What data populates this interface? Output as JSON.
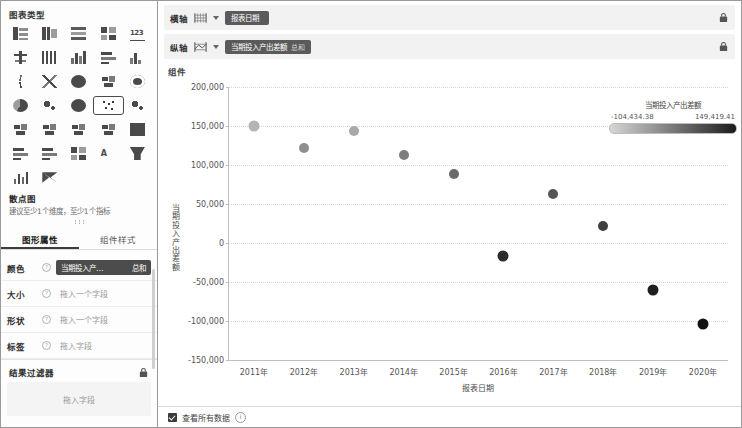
{
  "left_panel": {
    "title": "图表类型",
    "chart_type_icons": [
      {
        "name": "table-icon",
        "glyph": "g1"
      },
      {
        "name": "cross-table-icon",
        "glyph": "g2"
      },
      {
        "name": "detail-table-icon",
        "glyph": "g3"
      },
      {
        "name": "summary-table-icon",
        "glyph": "g4"
      },
      {
        "name": "kpi-number-icon",
        "glyph": "g5",
        "text": "123"
      },
      {
        "name": "column-chart-icon",
        "glyph": "g6"
      },
      {
        "name": "stacked-column-icon",
        "glyph": "g7"
      },
      {
        "name": "bar-chart-icon",
        "glyph": "g8"
      },
      {
        "name": "horizontal-bar-icon",
        "glyph": "g9"
      },
      {
        "name": "histogram-icon",
        "glyph": "ghist"
      },
      {
        "name": "area-chart-icon",
        "glyph": "g11"
      },
      {
        "name": "radar-chart-icon",
        "glyph": "g12"
      },
      {
        "name": "polar-chart-icon",
        "glyph": "gcirc"
      },
      {
        "name": "map-chart-icon",
        "glyph": "gmap"
      },
      {
        "name": "gauge-chart-icon",
        "glyph": "gring"
      },
      {
        "name": "pie-chart-icon",
        "glyph": "ghalf"
      },
      {
        "name": "donut-chart-icon",
        "glyph": "gbubble"
      },
      {
        "name": "sunburst-chart-icon",
        "glyph": "gcirc"
      },
      {
        "name": "scatter-chart-icon",
        "glyph": "gscat",
        "selected": true
      },
      {
        "name": "bubble-chart-icon",
        "glyph": "gbubble"
      },
      {
        "name": "tree-map-icon",
        "glyph": "gmap"
      },
      {
        "name": "funnel-map-icon",
        "glyph": "gmap"
      },
      {
        "name": "relation-chart-icon",
        "glyph": "gmap"
      },
      {
        "name": "sankey-chart-icon",
        "glyph": "gmap"
      },
      {
        "name": "heatmap-icon",
        "glyph": "gsq"
      },
      {
        "name": "gantt-chart-icon",
        "glyph": "g9"
      },
      {
        "name": "timeline-chart-icon",
        "glyph": "g9"
      },
      {
        "name": "matrix-chart-icon",
        "glyph": "g4"
      },
      {
        "name": "word-cloud-icon",
        "glyph": "gA",
        "text": "A"
      },
      {
        "name": "funnel-chart-icon",
        "glyph": "gfunnel"
      },
      {
        "name": "waterfall-chart-icon",
        "glyph": "g10"
      },
      {
        "name": "butterfly-chart-icon",
        "glyph": "gbow"
      }
    ],
    "selected_type_name": "散点图",
    "selected_type_hint": "建议至少1个维度，至少1个指标",
    "tabs": [
      {
        "label": "图形属性",
        "active": true
      },
      {
        "label": "组件样式",
        "active": false
      }
    ],
    "property_rows": [
      {
        "label": "颜色",
        "kind": "pill",
        "value": "当期投入产…",
        "badge": "总和"
      },
      {
        "label": "大小",
        "kind": "placeholder",
        "placeholder": "拖入一个字段"
      },
      {
        "label": "形状",
        "kind": "placeholder",
        "placeholder": "拖入一个字段"
      },
      {
        "label": "标签",
        "kind": "placeholder",
        "placeholder": "拖入字段"
      }
    ],
    "filter_section": {
      "title": "结果过滤器",
      "lock_icon": "lock-icon",
      "dropzone_placeholder": "拖入字段"
    }
  },
  "axis_bars": [
    {
      "name": "横轴",
      "icon": "horizontal-axis-icon",
      "field": "报表日期",
      "agg": "",
      "lock_icon": "lock-icon"
    },
    {
      "name": "纵轴",
      "icon": "vertical-axis-icon",
      "field": "当期投入产出差额",
      "agg": "总和",
      "lock_icon": "lock-icon"
    }
  ],
  "component_label": "组件",
  "legend": {
    "title": "当期投入产出差额",
    "min_label": "-104,434.38",
    "max_label": "149,419.41",
    "gradient_from": "#d6d6d6",
    "gradient_to": "#1c1c1c"
  },
  "status_bar": {
    "checkbox_checked": true,
    "label": "查看所有数据",
    "info_icon": "info-icon",
    "info_glyph": "i"
  },
  "chart_data": {
    "type": "scatter",
    "title": "",
    "xlabel": "报表日期",
    "ylabel": "当期投入产出差额",
    "categories": [
      "2011年",
      "2012年",
      "2013年",
      "2014年",
      "2015年",
      "2016年",
      "2017年",
      "2018年",
      "2019年",
      "2020年"
    ],
    "values": [
      149419.41,
      122000,
      143000,
      112800,
      88000,
      -17000,
      62500,
      21500,
      -60000,
      -104434.38
    ],
    "point_colors": [
      "#b4b4b4",
      "#8f8f8f",
      "#a8a8a8",
      "#7d7d7d",
      "#6a6a6a",
      "#2b2b2b",
      "#555555",
      "#3f3f3f",
      "#1f1f1f",
      "#121212"
    ],
    "point_sizes": [
      11,
      10,
      10,
      10,
      10,
      11,
      10,
      10,
      11,
      11
    ],
    "ylim": [
      -150000,
      200000
    ],
    "yticks": [
      200000,
      150000,
      100000,
      50000,
      0,
      -50000,
      -100000,
      -150000
    ],
    "ytick_labels": [
      "200,000",
      "150,000",
      "100,000",
      "50,000",
      "0",
      "-50,000",
      "-100,000",
      "-150,000"
    ],
    "grid": true,
    "legend_position": "right",
    "color_scale": {
      "min": -104434.38,
      "max": 149419.41
    }
  }
}
